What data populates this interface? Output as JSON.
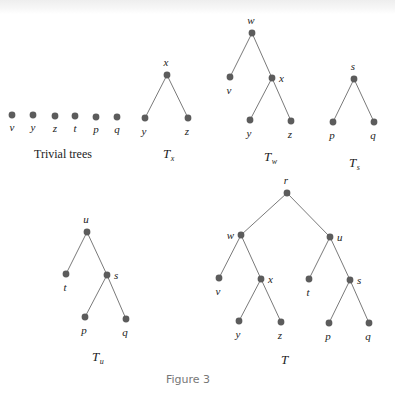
{
  "figure": {
    "caption": "Figure 3",
    "colors": {
      "node": "#5c5c5c",
      "edge": "#7a7a7a",
      "text": "#222222",
      "caption": "#777777"
    }
  },
  "trivial_trees": {
    "caption": "Trivial trees",
    "nodes": [
      {
        "label": "v",
        "x": 12,
        "y": 115
      },
      {
        "label": "y",
        "x": 33,
        "y": 115
      },
      {
        "label": "z",
        "x": 55,
        "y": 116
      },
      {
        "label": "t",
        "x": 75,
        "y": 116
      },
      {
        "label": "p",
        "x": 96,
        "y": 117
      },
      {
        "label": "q",
        "x": 117,
        "y": 117
      }
    ]
  },
  "trees": [
    {
      "id": "Tx",
      "name": "T",
      "sub": "x",
      "name_pos": [
        163,
        158
      ],
      "nodes": [
        {
          "id": "x",
          "label": "x",
          "x": 167,
          "y": 75,
          "lpos": "above"
        },
        {
          "id": "y",
          "label": "y",
          "x": 145,
          "y": 118,
          "lpos": "below"
        },
        {
          "id": "z",
          "label": "z",
          "x": 188,
          "y": 118,
          "lpos": "below"
        }
      ],
      "edges": [
        [
          "x",
          "y"
        ],
        [
          "x",
          "z"
        ]
      ]
    },
    {
      "id": "Tw",
      "name": "T",
      "sub": "w",
      "name_pos": [
        264,
        161
      ],
      "nodes": [
        {
          "id": "w",
          "label": "w",
          "x": 252,
          "y": 33,
          "lpos": "above"
        },
        {
          "id": "v",
          "label": "v",
          "x": 230,
          "y": 77,
          "lpos": "below"
        },
        {
          "id": "x",
          "label": "x",
          "x": 272,
          "y": 78,
          "lpos": "right"
        },
        {
          "id": "y",
          "label": "y",
          "x": 250,
          "y": 120,
          "lpos": "below"
        },
        {
          "id": "z",
          "label": "z",
          "x": 291,
          "y": 121,
          "lpos": "below"
        }
      ],
      "edges": [
        [
          "w",
          "v"
        ],
        [
          "w",
          "x"
        ],
        [
          "x",
          "y"
        ],
        [
          "x",
          "z"
        ]
      ]
    },
    {
      "id": "Ts",
      "name": "T",
      "sub": "s",
      "name_pos": [
        349,
        167
      ],
      "nodes": [
        {
          "id": "s",
          "label": "s",
          "x": 354,
          "y": 79,
          "lpos": "above"
        },
        {
          "id": "p",
          "label": "p",
          "x": 333,
          "y": 122,
          "lpos": "below"
        },
        {
          "id": "q",
          "label": "q",
          "x": 374,
          "y": 122,
          "lpos": "below"
        }
      ],
      "edges": [
        [
          "s",
          "p"
        ],
        [
          "s",
          "q"
        ]
      ]
    },
    {
      "id": "Tu",
      "name": "T",
      "sub": "u",
      "name_pos": [
        92,
        361
      ],
      "nodes": [
        {
          "id": "u",
          "label": "u",
          "x": 87,
          "y": 232,
          "lpos": "above"
        },
        {
          "id": "t",
          "label": "t",
          "x": 66,
          "y": 274,
          "lpos": "below"
        },
        {
          "id": "s",
          "label": "s",
          "x": 107,
          "y": 275,
          "lpos": "right"
        },
        {
          "id": "p",
          "label": "p",
          "x": 85,
          "y": 317,
          "lpos": "below"
        },
        {
          "id": "q",
          "label": "q",
          "x": 126,
          "y": 319,
          "lpos": "below"
        }
      ],
      "edges": [
        [
          "u",
          "t"
        ],
        [
          "u",
          "s"
        ],
        [
          "s",
          "p"
        ],
        [
          "s",
          "q"
        ]
      ]
    },
    {
      "id": "T",
      "name": "T",
      "sub": "",
      "name_pos": [
        281,
        364
      ],
      "nodes": [
        {
          "id": "r",
          "label": "r",
          "x": 287,
          "y": 193,
          "lpos": "above"
        },
        {
          "id": "w",
          "label": "w",
          "x": 241,
          "y": 235,
          "lpos": "left"
        },
        {
          "id": "u",
          "label": "u",
          "x": 330,
          "y": 237,
          "lpos": "right"
        },
        {
          "id": "v",
          "label": "v",
          "x": 219,
          "y": 278,
          "lpos": "below"
        },
        {
          "id": "x",
          "label": "x",
          "x": 261,
          "y": 279,
          "lpos": "right"
        },
        {
          "id": "t",
          "label": "t",
          "x": 309,
          "y": 279,
          "lpos": "below"
        },
        {
          "id": "s",
          "label": "s",
          "x": 350,
          "y": 280,
          "lpos": "right"
        },
        {
          "id": "y",
          "label": "y",
          "x": 239,
          "y": 321,
          "lpos": "below"
        },
        {
          "id": "z",
          "label": "z",
          "x": 281,
          "y": 322,
          "lpos": "below"
        },
        {
          "id": "p",
          "label": "p",
          "x": 329,
          "y": 323,
          "lpos": "below"
        },
        {
          "id": "q",
          "label": "q",
          "x": 369,
          "y": 323,
          "lpos": "below"
        }
      ],
      "edges": [
        [
          "r",
          "w"
        ],
        [
          "r",
          "u"
        ],
        [
          "w",
          "v"
        ],
        [
          "w",
          "x"
        ],
        [
          "x",
          "y"
        ],
        [
          "x",
          "z"
        ],
        [
          "u",
          "t"
        ],
        [
          "u",
          "s"
        ],
        [
          "s",
          "p"
        ],
        [
          "s",
          "q"
        ]
      ]
    }
  ]
}
